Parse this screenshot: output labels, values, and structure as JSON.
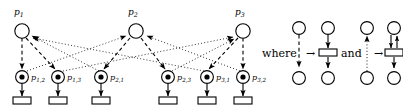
{
  "figure": {
    "type": "petri-net-diagram",
    "colors": {
      "ink": "#000000",
      "background": "#ffffff"
    }
  },
  "top_places": [
    {
      "id": "p1",
      "label": "p",
      "sub": "1",
      "cx": 22,
      "cy": 31
    },
    {
      "id": "p2",
      "label": "p",
      "sub": "2",
      "cx": 136,
      "cy": 31
    },
    {
      "id": "p3",
      "label": "p",
      "sub": "3",
      "cx": 243,
      "cy": 31
    }
  ],
  "bottom_places": [
    {
      "id": "p12",
      "label": "p",
      "sub": "1,2",
      "cx": 22,
      "cy": 77,
      "marked": true
    },
    {
      "id": "p13",
      "label": "p",
      "sub": "1,3",
      "cx": 58,
      "cy": 77,
      "marked": true
    },
    {
      "id": "p21",
      "label": "p",
      "sub": "2,1",
      "cx": 101,
      "cy": 77,
      "marked": true
    },
    {
      "id": "p23",
      "label": "p",
      "sub": "2,3",
      "cx": 168,
      "cy": 77,
      "marked": true
    },
    {
      "id": "p31",
      "label": "p",
      "sub": "3,1",
      "cx": 207,
      "cy": 77,
      "marked": true
    },
    {
      "id": "p32",
      "label": "p",
      "sub": "3,2",
      "cx": 243,
      "cy": 77,
      "marked": true
    }
  ],
  "transitions": [
    {
      "id": "t12",
      "x": 22,
      "y": 100
    },
    {
      "id": "t13",
      "x": 58,
      "y": 100
    },
    {
      "id": "t21",
      "x": 101,
      "y": 100
    },
    {
      "id": "t23",
      "x": 168,
      "y": 100
    },
    {
      "id": "t31",
      "x": 207,
      "y": 100
    },
    {
      "id": "t32",
      "x": 243,
      "y": 100
    }
  ],
  "dashed_arcs": [
    {
      "from": "p1",
      "to": "p12"
    },
    {
      "from": "p1",
      "to": "p13"
    },
    {
      "from": "p2",
      "to": "p21"
    },
    {
      "from": "p2",
      "to": "p23"
    },
    {
      "from": "p3",
      "to": "p31"
    },
    {
      "from": "p3",
      "to": "p32"
    }
  ],
  "dotted_arcs": [
    {
      "from": "p21",
      "to": "p1"
    },
    {
      "from": "p31",
      "to": "p1"
    },
    {
      "from": "p12",
      "to": "p2"
    },
    {
      "from": "p32",
      "to": "p2"
    },
    {
      "from": "p13",
      "to": "p3"
    },
    {
      "from": "p23",
      "to": "p3"
    }
  ],
  "legend": {
    "where_label": "where",
    "and_label": "and",
    "maps_to_symbol": "→",
    "rules": [
      {
        "id": "dashed-rule",
        "source_style": "dashed",
        "source_direction": "down",
        "target": "place-transition-place-down"
      },
      {
        "id": "dotted-rule",
        "source_style": "dotted",
        "source_direction": "up",
        "target": "place-bidirectional-transition-place"
      }
    ]
  }
}
